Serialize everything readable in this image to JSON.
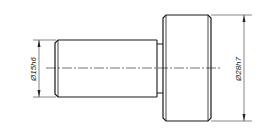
{
  "drawing": {
    "type": "technical-drawing",
    "subject": "stepped shaft / pin",
    "colors": {
      "line": "#1a1a1a",
      "background": "#ffffff"
    },
    "dimensions": [
      {
        "label": "Ø15h6",
        "feature": "shaft diameter"
      },
      {
        "label": "Ø28h7",
        "feature": "head diameter"
      }
    ]
  }
}
